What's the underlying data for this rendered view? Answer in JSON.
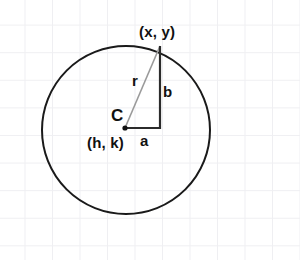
{
  "figure": {
    "background_color": "#ffffff",
    "grid": {
      "visible": true,
      "color": "#efeff2",
      "spacing_px": 27.5
    },
    "circle": {
      "center_x": 126,
      "center_y": 130,
      "radius": 84,
      "stroke_color": "#1a1a1a",
      "stroke_width": 2
    },
    "center_point": {
      "x": 125,
      "y": 128,
      "color": "#111111"
    },
    "triangle": {
      "leg_horizontal": {
        "x1": 125,
        "y1": 128,
        "x2": 160,
        "y2": 128,
        "color": "#2b2b2b"
      },
      "leg_vertical": {
        "x1": 160,
        "y1": 128,
        "x2": 160,
        "y2": 46,
        "color": "#2b2b2b"
      },
      "hypotenuse": {
        "x1": 125,
        "y1": 128,
        "x2": 160,
        "y2": 46,
        "color": "#9a9a9a"
      }
    },
    "labels": {
      "point_on_circle": "(x, y)",
      "radius": "r",
      "vertical_leg": "b",
      "horizontal_leg": "a",
      "center_letter": "C",
      "center_coords": "(h, k)"
    }
  }
}
